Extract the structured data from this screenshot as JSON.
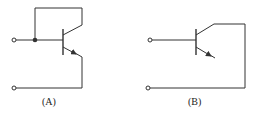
{
  "diagram": {
    "type": "transistor-circuits",
    "circuits": [
      {
        "id": "A",
        "label": "(A)",
        "description": "NPN transistor with collector tied back to base (diode-connected); input at base node, output from emitter to bottom terminal"
      },
      {
        "id": "B",
        "label": "(B)",
        "description": "NPN transistor with input at base; collector connected to bottom terminal; emitter left open"
      }
    ],
    "colors": {
      "stroke": "#333333",
      "background": "#ffffff"
    }
  }
}
